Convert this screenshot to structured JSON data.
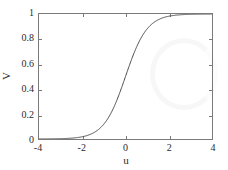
{
  "chart_data": {
    "type": "line",
    "title": "",
    "subtitle": "",
    "xlabel": "u",
    "ylabel": "V",
    "xlim": [
      -4,
      4
    ],
    "ylim": [
      0,
      1
    ],
    "xticks": [
      -4,
      -2,
      0,
      2,
      4
    ],
    "yticks": [
      0,
      0.2,
      0.4,
      0.6,
      0.8,
      1
    ],
    "xticklabels": [
      "-4",
      "-2",
      "0",
      "2",
      "4"
    ],
    "yticklabels": [
      "0",
      "0.2",
      "0.4",
      "0.6",
      "0.8",
      "1"
    ],
    "grid": false,
    "legend": null,
    "annotations": [],
    "line_color": "#4a4a4a",
    "axis_color": "#7a7a7a",
    "background_color": "#ffffff",
    "series": [
      {
        "name": "sigmoid",
        "description": "logistic activation V = 1 / (1 + exp(-2u))",
        "x": [
          -4,
          -3.75,
          -3.5,
          -3.25,
          -3,
          -2.75,
          -2.5,
          -2.25,
          -2,
          -1.75,
          -1.5,
          -1.25,
          -1,
          -0.75,
          -0.5,
          -0.25,
          0,
          0.25,
          0.5,
          0.75,
          1,
          1.25,
          1.5,
          1.75,
          2,
          2.25,
          2.5,
          2.75,
          3,
          3.25,
          3.5,
          3.75,
          4
        ],
        "values": [
          0.0003,
          0.0006,
          0.0009,
          0.0015,
          0.0025,
          0.0041,
          0.0067,
          0.011,
          0.018,
          0.029,
          0.047,
          0.076,
          0.119,
          0.182,
          0.269,
          0.378,
          0.5,
          0.622,
          0.731,
          0.818,
          0.881,
          0.924,
          0.953,
          0.971,
          0.982,
          0.989,
          0.993,
          0.996,
          0.998,
          0.9985,
          0.9991,
          0.9994,
          0.9997
        ]
      }
    ]
  },
  "axes": {
    "xlabel": "u",
    "ylabel": "V",
    "xticklabels": [
      "-4",
      "-2",
      "0",
      "2",
      "4"
    ],
    "yticklabels": [
      "0",
      "0.2",
      "0.4",
      "0.6",
      "0.8",
      "1"
    ]
  }
}
